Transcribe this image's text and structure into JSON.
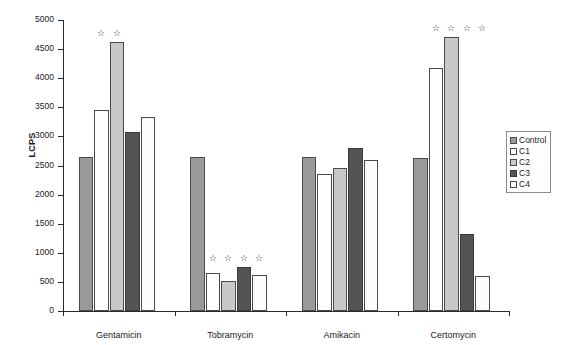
{
  "chart_data": {
    "type": "bar",
    "title": "",
    "xlabel": "",
    "ylabel": "LCPS",
    "ylim": [
      0,
      5000
    ],
    "ytick_step": 500,
    "yticks": [
      "5000",
      "4500",
      "4000",
      "3500",
      "3000",
      "2500",
      "2000",
      "1500",
      "1000",
      "500",
      "0"
    ],
    "grid": false,
    "legend_position": "right",
    "categories": [
      "Gentamicin",
      "Tobramycin",
      "Amikacin",
      "Certomycin"
    ],
    "series": [
      {
        "name": "Control",
        "color": "#9a9a9a",
        "values": [
          2650,
          2650,
          2640,
          2630
        ],
        "significance": [
          false,
          false,
          false,
          false
        ]
      },
      {
        "name": "C1",
        "color": "#ffffff",
        "values": [
          3450,
          660,
          2350,
          4180
        ],
        "significance": [
          true,
          true,
          false,
          true
        ]
      },
      {
        "name": "C2",
        "color": "#c8c8c8",
        "values": [
          4630,
          520,
          2460,
          4700
        ],
        "significance": [
          true,
          true,
          false,
          true
        ]
      },
      {
        "name": "C3",
        "color": "#545454",
        "values": [
          3080,
          750,
          2800,
          1320
        ],
        "significance": [
          false,
          true,
          false,
          true
        ]
      },
      {
        "name": "C4",
        "color": "#fcfcfc",
        "values": [
          3330,
          620,
          2590,
          600
        ],
        "significance": [
          false,
          true,
          false,
          true
        ]
      }
    ],
    "significance_marker": "☆"
  },
  "legend": {
    "items": [
      {
        "label": "Control",
        "key": "control"
      },
      {
        "label": "C1",
        "key": "c1"
      },
      {
        "label": "C2",
        "key": "c2"
      },
      {
        "label": "C3",
        "key": "c3"
      },
      {
        "label": "C4",
        "key": "c4"
      }
    ]
  }
}
